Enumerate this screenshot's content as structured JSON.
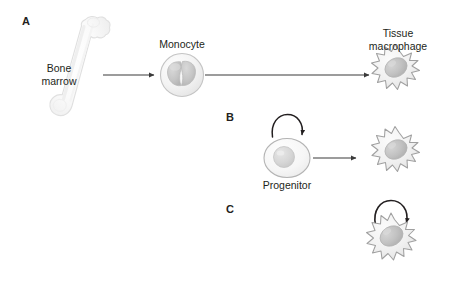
{
  "figure": {
    "background_color": "#ffffff",
    "width": 455,
    "height": 287
  },
  "panels": [
    {
      "id": "A",
      "label": "A",
      "x": 22,
      "y": 16
    },
    {
      "id": "B",
      "label": "B",
      "x": 226,
      "y": 112
    },
    {
      "id": "C",
      "label": "C",
      "x": 226,
      "y": 204
    }
  ],
  "labels": {
    "bone_marrow": "Bone\nmarrow",
    "monocyte": "Monocyte",
    "tissue_macrophage": "Tissue\nmacrophage",
    "progenitor": "Progenitor"
  },
  "cells": {
    "bone": {
      "name": "bone-marrow-femur",
      "fill": "#fbfbfb",
      "stroke": "#e2e2e2"
    },
    "monocyte": {
      "name": "monocyte-cell",
      "cytoplasm_fill": "#f4f4f4",
      "nucleus_fill": "#c9c9c9",
      "stroke": "#bdbdbd",
      "nucleus_shape": "bilobed"
    },
    "macrophage": {
      "name": "tissue-macrophage-cell",
      "cytoplasm_fill": "#f2f2f2",
      "nucleus_fill": "#c4c4c4",
      "stroke": "#9e9e9e",
      "shape": "spiky-stellate"
    },
    "progenitor": {
      "name": "progenitor-cell",
      "cytoplasm_fill": "#f7f7f7",
      "nucleus_fill": "#d8d8d8",
      "stroke": "#b0b0b0",
      "shape": "oval"
    }
  },
  "arrows": {
    "color": "#3a3a3a",
    "bone_to_monocyte": {
      "from_x": 103,
      "from_y": 75,
      "to_x": 157,
      "to_y": 75
    },
    "monocyte_to_macrophage": {
      "from_x": 205,
      "from_y": 75,
      "to_x": 372,
      "to_y": 75
    },
    "progenitor_to_macrophage": {
      "from_x": 313,
      "from_y": 158,
      "to_x": 359,
      "to_y": 158
    },
    "self_renewal_b": {
      "cx": 287,
      "cy": 127,
      "r": 14,
      "type": "curved-self-renewal"
    },
    "self_renewal_c": {
      "cx": 392,
      "cy": 213,
      "r": 15,
      "type": "curved-self-renewal"
    }
  },
  "colors": {
    "text": "#231f20",
    "arrow": "#3a3a3a",
    "cell_outline": "#9e9e9e",
    "background": "#ffffff"
  }
}
